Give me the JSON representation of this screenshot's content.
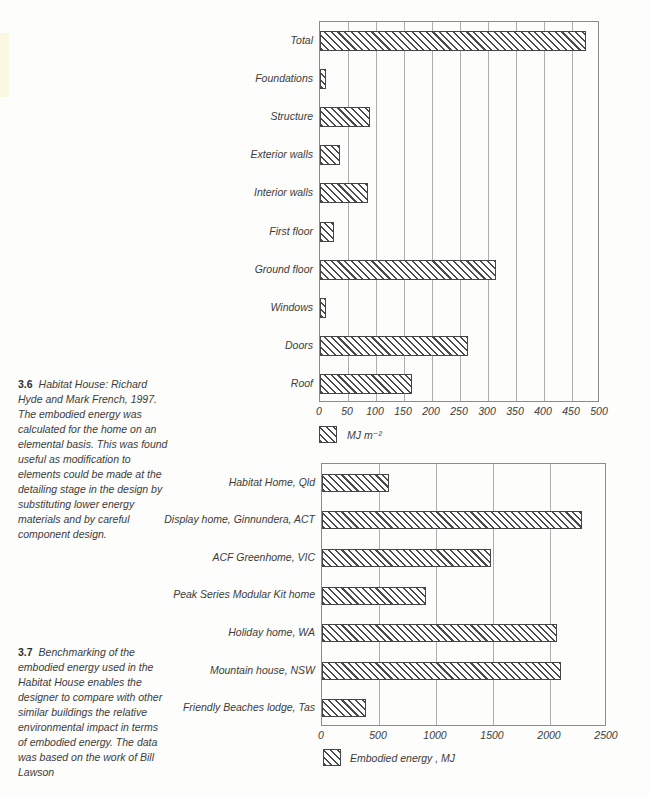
{
  "page": {
    "background": "#fdfdfb",
    "text_color": "#3c3c3c",
    "hatch_color": "#4a4a4a",
    "grid_color": "#adadad"
  },
  "captions": [
    {
      "number": "3.6",
      "lines": [
        "Habitat House: Richard",
        "Hyde and Mark French, 1997.",
        "The embodied energy was",
        "calculated for the home on an",
        "elemental basis. This was found",
        "useful as modification to",
        "elements could be made at the",
        "detailing stage in the design by",
        "substituting lower energy",
        "materials and by careful",
        "component design."
      ]
    },
    {
      "number": "3.7",
      "lines": [
        "Benchmarking of the",
        "embodied energy used in the",
        "Habitat House enables the",
        "designer to compare with other",
        "similar buildings the relative",
        "environmental impact in terms",
        "of embodied energy. The data",
        "was based on the work of Bill",
        "Lawson"
      ]
    }
  ],
  "chart_data": [
    {
      "type": "bar",
      "orientation": "horizontal",
      "title": "",
      "categories": [
        "Total",
        "Foundations",
        "Structure",
        "Exterior walls",
        "Interior walls",
        "First floor",
        "Ground floor",
        "Windows",
        "Doors",
        "Roof"
      ],
      "values": [
        475,
        10,
        90,
        35,
        85,
        25,
        315,
        10,
        265,
        165
      ],
      "xlim": [
        0,
        500
      ],
      "xticks": [
        0,
        50,
        100,
        150,
        200,
        250,
        300,
        350,
        400,
        450,
        500
      ],
      "legend": "MJ m⁻²",
      "grid": "vertical",
      "bar_fill": "diagonal-hatch"
    },
    {
      "type": "bar",
      "orientation": "horizontal",
      "title": "",
      "categories": [
        "Habitat Home, Qld",
        "Display home, Ginnundera, ACT",
        "ACF Greenhome, VIC",
        "Peak Series Modular Kit home",
        "Holiday home, WA",
        "Mountain house, NSW",
        "Friendly Beaches lodge, Tas"
      ],
      "values": [
        590,
        2280,
        1480,
        910,
        2060,
        2100,
        390
      ],
      "xlim": [
        0,
        2500
      ],
      "xticks": [
        0,
        500,
        1000,
        1500,
        2000,
        2500
      ],
      "legend": "Embodied energy , MJ",
      "grid": "vertical",
      "bar_fill": "diagonal-hatch"
    }
  ]
}
